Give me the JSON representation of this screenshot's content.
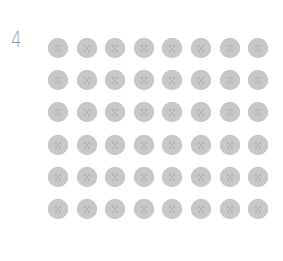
{
  "label": {
    "text": "4"
  },
  "grid": {
    "rows": 6,
    "columns": 8,
    "total": 48,
    "item_icon": "cookie-icon",
    "item_color": "#c8c8c8"
  }
}
